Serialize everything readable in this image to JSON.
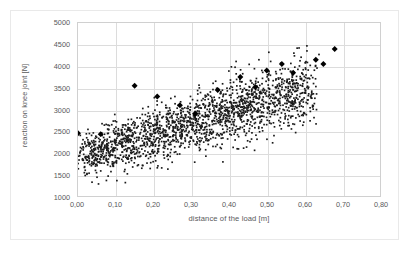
{
  "chart_data": {
    "type": "scatter",
    "title": "",
    "xlabel": "distance of the load [m]",
    "ylabel": "reaction on knee joint [N]",
    "xlim": [
      0.0,
      0.8
    ],
    "ylim": [
      1000,
      5000
    ],
    "grid": true,
    "legend": "none",
    "decimal_separator": ",",
    "x_ticks": [
      "0,00",
      "0,10",
      "0,20",
      "0,30",
      "0,40",
      "0,50",
      "0,60",
      "0,70",
      "0,80"
    ],
    "x_tick_values": [
      0.0,
      0.1,
      0.2,
      0.3,
      0.4,
      0.5,
      0.6,
      0.7,
      0.8
    ],
    "y_ticks": [
      "5000",
      "4500",
      "4000",
      "3500",
      "3000",
      "2500",
      "2000",
      "1500",
      "1000"
    ],
    "y_tick_values": [
      5000,
      4500,
      4000,
      3500,
      3000,
      2500,
      2000,
      1500,
      1000
    ],
    "series": [
      {
        "name": "measurements",
        "marker": "small-dot",
        "color": "#1a1a1a",
        "size": 1.6,
        "point_count": 2000,
        "distribution": {
          "description": "dense cloud, reaction rises with load distance",
          "x_range": [
            0.0,
            0.62
          ],
          "y_range": [
            1200,
            4500
          ],
          "x_mode": 0.27,
          "trend_slope_N_per_m": 2600,
          "trend_intercept_N": 1900,
          "y_spread_N": 520
        }
      },
      {
        "name": "mean markers",
        "marker": "diamond",
        "color": "#000000",
        "size": 6,
        "x": [
          0.0,
          0.06,
          0.15,
          0.21,
          0.27,
          0.31,
          0.37,
          0.43,
          0.47,
          0.5,
          0.54,
          0.57,
          0.63,
          0.65,
          0.68
        ],
        "y": [
          2450,
          2430,
          3550,
          3300,
          3100,
          2900,
          3450,
          3750,
          3520,
          3900,
          4050,
          3850,
          4150,
          4050,
          4400
        ]
      }
    ]
  },
  "axes": {
    "y_title": "reaction on knee joint [N]",
    "x_title": "distance of the load [m]"
  }
}
